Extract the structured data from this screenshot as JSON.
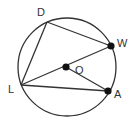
{
  "diagram": {
    "type": "geometry-circle",
    "colors": {
      "stroke": "#333333",
      "point": "#111111",
      "background": "#ffffff"
    },
    "circle": {
      "cx": 67,
      "cy": 67,
      "r": 49
    },
    "points": [
      {
        "id": "D",
        "label": "D",
        "x": 47,
        "y": 22,
        "filled": false,
        "label_x": 37,
        "label_y": 16
      },
      {
        "id": "W",
        "label": "W",
        "x": 111,
        "y": 46,
        "filled": true,
        "label_x": 117,
        "label_y": 47
      },
      {
        "id": "O",
        "label": "O",
        "x": 66,
        "y": 67,
        "filled": true,
        "label_x": 75,
        "label_y": 74
      },
      {
        "id": "L",
        "label": "L",
        "x": 21,
        "y": 85,
        "filled": false,
        "label_x": 8,
        "label_y": 93
      },
      {
        "id": "A",
        "label": "A",
        "x": 108,
        "y": 91,
        "filled": true,
        "label_x": 114,
        "label_y": 98
      }
    ],
    "segments": [
      {
        "from": "D",
        "to": "W"
      },
      {
        "from": "D",
        "to": "L"
      },
      {
        "from": "L",
        "to": "W"
      },
      {
        "from": "L",
        "to": "A"
      },
      {
        "from": "O",
        "to": "A"
      }
    ]
  }
}
